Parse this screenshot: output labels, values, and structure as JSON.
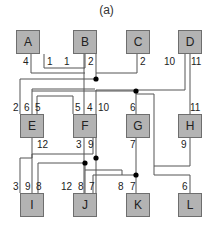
{
  "title": "(a)",
  "colors": {
    "box_fill": "#b3b3b3",
    "box_border": "#6e6e6e",
    "wire": "#555555",
    "junction": "#000000"
  },
  "boxes": [
    {
      "id": "A",
      "label": "A",
      "x": 16,
      "y": 30
    },
    {
      "id": "B",
      "label": "B",
      "x": 73,
      "y": 30
    },
    {
      "id": "C",
      "label": "C",
      "x": 126,
      "y": 30
    },
    {
      "id": "D",
      "label": "D",
      "x": 178,
      "y": 30
    },
    {
      "id": "E",
      "label": "E",
      "x": 20,
      "y": 114
    },
    {
      "id": "F",
      "label": "F",
      "x": 73,
      "y": 114
    },
    {
      "id": "G",
      "label": "G",
      "x": 126,
      "y": 114
    },
    {
      "id": "H",
      "label": "H",
      "x": 178,
      "y": 114
    },
    {
      "id": "I",
      "label": "I",
      "x": 20,
      "y": 193
    },
    {
      "id": "J",
      "label": "J",
      "x": 73,
      "y": 193
    },
    {
      "id": "K",
      "label": "K",
      "x": 126,
      "y": 193
    },
    {
      "id": "L",
      "label": "L",
      "x": 178,
      "y": 193
    }
  ],
  "pins": [
    {
      "label": "4",
      "x": 23,
      "y": 57
    },
    {
      "label": "1",
      "x": 47,
      "y": 57
    },
    {
      "label": "1",
      "x": 64,
      "y": 57
    },
    {
      "label": "2",
      "x": 88,
      "y": 57
    },
    {
      "label": "2",
      "x": 140,
      "y": 57
    },
    {
      "label": "10",
      "x": 164,
      "y": 57
    },
    {
      "label": "11",
      "x": 191,
      "y": 57
    },
    {
      "label": "2",
      "x": 13,
      "y": 103
    },
    {
      "label": "6",
      "x": 24,
      "y": 103
    },
    {
      "label": "5",
      "x": 35,
      "y": 103
    },
    {
      "label": "5",
      "x": 75,
      "y": 103
    },
    {
      "label": "4",
      "x": 87,
      "y": 103
    },
    {
      "label": "10",
      "x": 98,
      "y": 103
    },
    {
      "label": "6",
      "x": 130,
      "y": 103
    },
    {
      "label": "11",
      "x": 190,
      "y": 103
    },
    {
      "label": "12",
      "x": 37,
      "y": 140
    },
    {
      "label": "3",
      "x": 76,
      "y": 140
    },
    {
      "label": "9",
      "x": 88,
      "y": 140
    },
    {
      "label": "7",
      "x": 130,
      "y": 140
    },
    {
      "label": "9",
      "x": 181,
      "y": 140
    },
    {
      "label": "3",
      "x": 13,
      "y": 182
    },
    {
      "label": "9",
      "x": 25,
      "y": 182
    },
    {
      "label": "8",
      "x": 36,
      "y": 182
    },
    {
      "label": "12",
      "x": 61,
      "y": 182
    },
    {
      "label": "8",
      "x": 78,
      "y": 182
    },
    {
      "label": "7",
      "x": 89,
      "y": 182
    },
    {
      "label": "8",
      "x": 118,
      "y": 182
    },
    {
      "label": "7",
      "x": 130,
      "y": 182
    },
    {
      "label": "6",
      "x": 182,
      "y": 182
    }
  ],
  "wires": [
    "M44,54 V68 H85 V54",
    "M31,54 V73 H85",
    "M96,54 V79 H20 V114",
    "M137,54 V73 H96",
    "M185,54 V90 H96 V193",
    "M190,54 V114",
    "M32,114 V89 H95",
    "M136,114 V91 H32",
    "M37,114 V96 H73 V114",
    "M84,114 V54",
    "M32,138 V158 H20 V193",
    "M84,138 V193",
    "M93,138 V154 H32 V193",
    "M136,138 V193",
    "M190,138 V166 H154 V94 H136",
    "M154,166 V175 H190 V193",
    "M38,193 V163 H85",
    "M85,163 V193",
    "M93,193 V175 H136",
    "M122,175 V170 H85"
  ],
  "junctions": [
    {
      "x": 96,
      "y": 79
    },
    {
      "x": 136,
      "y": 91
    },
    {
      "x": 96,
      "y": 158
    },
    {
      "x": 85,
      "y": 163
    },
    {
      "x": 136,
      "y": 175
    }
  ]
}
